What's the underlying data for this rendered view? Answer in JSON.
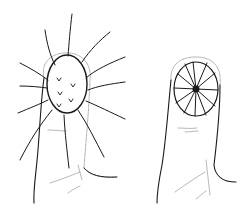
{
  "illustration": {
    "description": "Two pen sketches of fingertips",
    "figures": [
      {
        "id": "left",
        "subject": "fingertip with spiky ovoid knot and radiating lines"
      },
      {
        "id": "right",
        "subject": "fingertip with segmented radial disc"
      }
    ],
    "colors": {
      "ink": "#1a1a1a",
      "faint": "#9a9a9a",
      "background": "#ffffff"
    }
  }
}
